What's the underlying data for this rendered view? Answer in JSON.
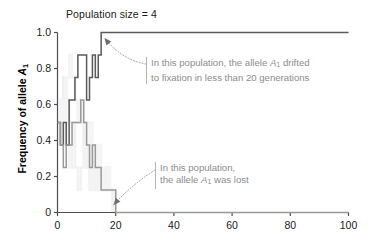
{
  "chart_data": {
    "type": "line",
    "title": "Population size = 4",
    "xlabel": "",
    "ylabel": "Frequency of allele A1",
    "ylabel_prefix": "Frequency of allele ",
    "ylabel_allele": "A",
    "ylabel_allele_sub": "1",
    "xlim": [
      0,
      100
    ],
    "ylim": [
      0,
      1.0
    ],
    "grid": false,
    "legend": "none",
    "xticks": [
      0,
      20,
      40,
      60,
      80,
      100
    ],
    "xtick_labels": [
      "0",
      "20",
      "40",
      "60",
      "80",
      "100"
    ],
    "yticks": [
      0,
      0.2,
      0.4,
      0.6,
      0.8,
      1.0
    ],
    "ytick_labels": [
      "0",
      "0.2",
      "0.4",
      "0.6",
      "0.8",
      "1.0"
    ],
    "series": [
      {
        "name": "fixed-population",
        "color": "#5a5a5a",
        "x": [
          0,
          1,
          2,
          3,
          4,
          5,
          6,
          7,
          8,
          9,
          10,
          11,
          12,
          13,
          14,
          15,
          16,
          20,
          40,
          60,
          80,
          100
        ],
        "values": [
          0.5,
          0.375,
          0.5,
          0.375,
          0.625,
          0.625,
          0.75,
          0.875,
          0.875,
          0.875,
          0.625,
          0.75,
          0.875,
          0.75,
          0.875,
          1.0,
          1.0,
          1.0,
          1.0,
          1.0,
          1.0,
          1.0
        ]
      },
      {
        "name": "lost-population",
        "color": "#999999",
        "x": [
          0,
          1,
          2,
          3,
          4,
          5,
          6,
          7,
          8,
          9,
          10,
          11,
          12,
          13,
          14,
          15,
          16,
          17,
          18,
          19,
          20,
          40,
          60,
          80,
          100
        ],
        "values": [
          0.5,
          0.375,
          0.25,
          0.375,
          0.375,
          0.5,
          0.5,
          0.5,
          0.625,
          0.5,
          0.375,
          0.25,
          0.375,
          0.25,
          0.25,
          0.125,
          0.125,
          0.125,
          0.125,
          0.125,
          0.0,
          0.0,
          0.0,
          0.0,
          0.0
        ]
      },
      {
        "name": "background-trace-1",
        "color": "#efefef",
        "x": [
          0,
          1,
          2,
          3,
          4,
          5,
          6,
          7,
          8,
          9,
          10,
          11,
          12,
          13,
          14,
          15,
          16,
          17,
          18,
          19,
          20
        ],
        "values": [
          0.5,
          0.625,
          0.75,
          0.625,
          0.5,
          0.375,
          0.5,
          0.625,
          0.5,
          0.375,
          0.25,
          0.375,
          0.25,
          0.125,
          0.25,
          0.125,
          0.125,
          0.25,
          0.125,
          0.0,
          0.0
        ]
      },
      {
        "name": "background-trace-2",
        "color": "#f2f2f2",
        "x": [
          0,
          1,
          2,
          3,
          4,
          5,
          6,
          7,
          8,
          9,
          10,
          11,
          12,
          13,
          14,
          15,
          16,
          17,
          18,
          19,
          20
        ],
        "values": [
          0.5,
          0.375,
          0.5,
          0.375,
          0.25,
          0.375,
          0.25,
          0.125,
          0.25,
          0.375,
          0.25,
          0.125,
          0.25,
          0.125,
          0.25,
          0.125,
          0.25,
          0.125,
          0.125,
          0.0,
          0.0
        ]
      },
      {
        "name": "background-trace-3",
        "color": "#f4f4f4",
        "x": [
          0,
          1,
          2,
          3,
          4,
          5,
          6,
          7,
          8,
          9,
          10,
          11,
          12,
          13,
          14,
          15,
          16,
          17,
          18,
          19,
          20
        ],
        "values": [
          0.5,
          0.625,
          0.5,
          0.75,
          0.875,
          0.75,
          0.625,
          0.5,
          0.625,
          0.5,
          0.375,
          0.5,
          0.375,
          0.25,
          0.375,
          0.25,
          0.125,
          0.25,
          0.125,
          0.125,
          0.0
        ]
      }
    ],
    "annotations": [
      {
        "name": "fixation-note",
        "line1_pre": "In this population, the allele ",
        "line1_allele": "A",
        "line1_allele_sub": "1",
        "line1_post": " drifted",
        "line2": "to fixation in less than 20 generations",
        "target_x": 15.5,
        "target_y": 1.0
      },
      {
        "name": "loss-note",
        "line1": "In this population,",
        "line2_pre": "the allele ",
        "line2_allele": "A",
        "line2_allele_sub": "1",
        "line2_post": " was lost",
        "target_x": 20,
        "target_y": 0.0
      }
    ],
    "colors": {
      "axis": "#4d4d4d",
      "text": "#1a1a1a",
      "annotation_text": "#8c8c8c",
      "annotation_rule": "#b4b4b4",
      "series_dark": "#5a5a5a",
      "series_light": "#999999",
      "background_trace": "#efefef"
    }
  }
}
